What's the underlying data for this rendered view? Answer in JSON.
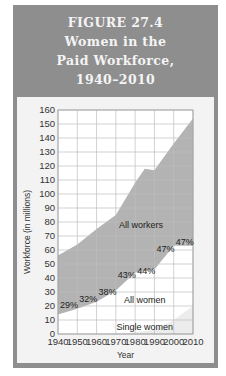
{
  "figure": {
    "label": "FIGURE 27.4",
    "title_lines": [
      "Women in the",
      "Paid Workforce,",
      "1940–2010"
    ]
  },
  "colors": {
    "frame": "#8e8e8e",
    "panel": "#f3f3f3",
    "plot_bg": "#ffffff",
    "all_workers_fill": "#b3b3b3",
    "all_women_fill": "#ffffff",
    "single_women_fill": "#ececec",
    "grid": "#bdbdbd"
  },
  "chart_data": {
    "type": "area",
    "title": "Women in the Paid Workforce, 1940–2010",
    "xlabel": "Year",
    "ylabel": "Workforce (in millions)",
    "xlim": [
      1940,
      2010
    ],
    "ylim": [
      0,
      160
    ],
    "x_ticks": [
      1940,
      1950,
      1960,
      1970,
      1980,
      1990,
      2000,
      2010
    ],
    "y_ticks": [
      0,
      10,
      20,
      30,
      40,
      50,
      60,
      70,
      80,
      90,
      100,
      110,
      120,
      130,
      140,
      150,
      160
    ],
    "grid": true,
    "series": [
      {
        "name": "All workers",
        "x": [
          1940,
          1950,
          1960,
          1970,
          1980,
          1985,
          1990,
          2000,
          2010
        ],
        "values": [
          56,
          64,
          75,
          85,
          108,
          118,
          117,
          136,
          154
        ]
      },
      {
        "name": "All women",
        "x": [
          1940,
          1950,
          1960,
          1970,
          1980,
          1990,
          2000,
          2010
        ],
        "values": [
          14,
          18,
          23,
          31,
          44,
          46,
          63,
          63
        ]
      },
      {
        "name": "Single women",
        "x": [
          1940,
          1950,
          1960,
          1970,
          1980,
          1990,
          2000,
          2010
        ],
        "values": [
          0,
          0,
          0,
          0,
          1,
          3,
          10,
          20
        ]
      }
    ],
    "annotations": [
      {
        "text": "29%",
        "x": 1940,
        "y": 21
      },
      {
        "text": "32%",
        "x": 1950,
        "y": 25
      },
      {
        "text": "38%",
        "x": 1960,
        "y": 30
      },
      {
        "text": "43%",
        "x": 1970,
        "y": 42
      },
      {
        "text": "44%",
        "x": 1980,
        "y": 45
      },
      {
        "text": "47%",
        "x": 1990,
        "y": 61
      },
      {
        "text": "47%",
        "x": 2000,
        "y": 66
      }
    ],
    "area_labels": [
      {
        "text": "All workers",
        "x": 1983,
        "y": 78
      },
      {
        "text": "All women",
        "x": 1985,
        "y": 24
      },
      {
        "text": "Single women",
        "x": 1985,
        "y": 5
      }
    ]
  }
}
